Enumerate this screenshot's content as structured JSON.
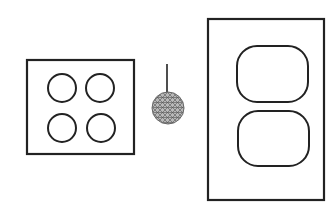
{
  "canvas": {
    "width": 331,
    "height": 210,
    "background": "#ffffff"
  },
  "colors": {
    "stroke": "#222222",
    "pendant_fill": "#b8b8b8",
    "pendant_mesh": "#555555"
  },
  "diagram": {
    "left_plate": {
      "label": "four-circle plate",
      "rect": {
        "x": 27,
        "y": 60,
        "w": 107,
        "h": 94
      },
      "circles": [
        {
          "cx": 62,
          "cy": 88,
          "r": 14
        },
        {
          "cx": 100,
          "cy": 88,
          "r": 14
        },
        {
          "cx": 62,
          "cy": 128,
          "r": 14
        },
        {
          "cx": 101,
          "cy": 128,
          "r": 14
        }
      ]
    },
    "pendant": {
      "label": "pendant light",
      "cord": {
        "x": 167,
        "y1": 64,
        "y2": 92
      },
      "ball": {
        "cx": 168,
        "cy": 108,
        "r": 16
      }
    },
    "right_plate": {
      "label": "duplex outlet plate",
      "rect": {
        "x": 208,
        "y": 19,
        "w": 116,
        "h": 181
      },
      "openings": [
        {
          "x": 237,
          "y": 46,
          "w": 71,
          "h": 56,
          "rx": 20
        },
        {
          "x": 238,
          "y": 111,
          "w": 71,
          "h": 55,
          "rx": 20
        }
      ]
    }
  }
}
